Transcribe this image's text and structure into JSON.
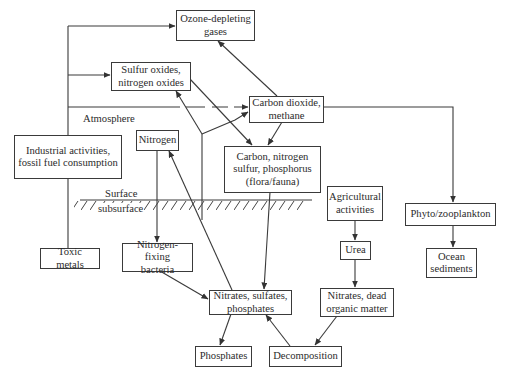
{
  "diagram": {
    "title": "",
    "nodes": {
      "ozone": {
        "label": "Ozone-depleting\ngases"
      },
      "sulfur_oxides": {
        "label": "Sulfur oxides,\nnitrogen oxides"
      },
      "carbon_dioxide": {
        "label": "Carbon dioxide,\nmethane"
      },
      "industrial": {
        "label": "Industrial activities,\nfossil fuel consumption"
      },
      "nitrogen": {
        "label": "Nitrogen"
      },
      "carbon_nsp": {
        "label": "Carbon, nitrogen\nsulfur, phosphorus\n(flora/fauna)"
      },
      "agricultural": {
        "label": "Agricultural\nactivities"
      },
      "phyto": {
        "label": "Phyto/zooplankton"
      },
      "toxic_metals": {
        "label": "Toxic metals"
      },
      "nitrogen_fixing": {
        "label": "Nitrogen-fixing\nbacteria"
      },
      "urea": {
        "label": "Urea"
      },
      "ocean_sediments": {
        "label": "Ocean\nsediments"
      },
      "nitrates_sulfates": {
        "label": "Nitrates, sulfates,\nphosphates"
      },
      "nitrates_dead": {
        "label": "Nitrates, dead\norganic matter"
      },
      "phosphates": {
        "label": "Phosphates"
      },
      "decomposition": {
        "label": "Decomposition"
      }
    },
    "zone_labels": {
      "atmosphere": "Atmosphere",
      "surface": "Surface",
      "subsurface": "subsurface"
    },
    "edges": [
      {
        "from": "industrial",
        "to": "ozone"
      },
      {
        "from": "industrial",
        "to": "sulfur_oxides"
      },
      {
        "from": "industrial",
        "to": "carbon_dioxide"
      },
      {
        "from": "industrial",
        "to": "toxic_metals"
      },
      {
        "from": "carbon_dioxide",
        "to": "ozone"
      },
      {
        "from": "carbon_dioxide",
        "to": "carbon_nsp"
      },
      {
        "from": "carbon_dioxide",
        "to": "phyto"
      },
      {
        "from": "sulfur_oxides",
        "to": "carbon_nsp"
      },
      {
        "from": "nitrates_sulfates",
        "to": "sulfur_oxides"
      },
      {
        "from": "nitrates_sulfates",
        "to": "carbon_dioxide"
      },
      {
        "from": "nitrates_sulfates",
        "to": "nitrogen"
      },
      {
        "from": "nitrogen",
        "to": "nitrogen_fixing"
      },
      {
        "from": "nitrogen_fixing",
        "to": "nitrates_sulfates"
      },
      {
        "from": "carbon_nsp",
        "to": "nitrates_sulfates"
      },
      {
        "from": "agricultural",
        "to": "urea"
      },
      {
        "from": "urea",
        "to": "nitrates_dead"
      },
      {
        "from": "nitrates_dead",
        "to": "decomposition"
      },
      {
        "from": "decomposition",
        "to": "nitrates_sulfates"
      },
      {
        "from": "nitrates_sulfates",
        "to": "phosphates"
      },
      {
        "from": "phyto",
        "to": "ocean_sediments"
      }
    ],
    "colors": {
      "line": "#3a3a3a",
      "background": "#ffffff",
      "text": "#2b2b2b"
    }
  }
}
